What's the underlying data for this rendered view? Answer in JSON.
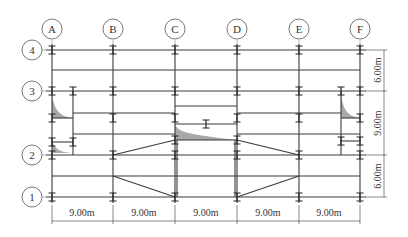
{
  "drawing": {
    "type": "structural floor plan (beam layout)",
    "column_axes": [
      "A",
      "B",
      "C",
      "D",
      "E",
      "F"
    ],
    "row_axes": [
      "4",
      "3",
      "2",
      "1"
    ],
    "bottom_dimensions": [
      "9.00m",
      "9.00m",
      "9.00m",
      "9.00m",
      "9.00m"
    ],
    "right_dimensions": [
      "6.00m",
      "9.00m",
      "6.00m"
    ]
  },
  "colors": {
    "line": "#3a3a3a",
    "shade": "#a8a8a8",
    "background": "#ffffff"
  }
}
